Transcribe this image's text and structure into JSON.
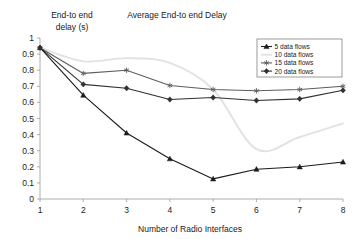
{
  "chart_data": {
    "type": "line",
    "title": "Average End-to end Delay",
    "xlabel": "Number of Radio Interfaces",
    "ylabel_line1": "End-to end",
    "ylabel_line2": "delay (s)",
    "ylabel": "End-to end delay (s)",
    "x": [
      1,
      2,
      3,
      4,
      5,
      6,
      7,
      8
    ],
    "xticks": [
      "1",
      "2",
      "3",
      "4",
      "5",
      "6",
      "7",
      "8"
    ],
    "yticks": [
      "0",
      "0.1",
      "0.2",
      "0.3",
      "0.4",
      "0.5",
      "0.6",
      "0.7",
      "0.8",
      "0.9",
      "1"
    ],
    "xlim": [
      1,
      8
    ],
    "ylim": [
      0,
      1
    ],
    "grid": false,
    "legend_position": "top-right",
    "series": [
      {
        "name": "5 data flows",
        "marker": "triangle",
        "color": "#1b1b1b",
        "values": [
          0.94,
          0.645,
          0.41,
          0.25,
          0.125,
          0.185,
          0.2,
          0.23
        ]
      },
      {
        "name": "10 data flows",
        "marker": "none",
        "color": "#e2e2e2",
        "smooth": true,
        "values": [
          0.94,
          0.855,
          0.875,
          0.845,
          0.68,
          0.31,
          0.385,
          0.47
        ]
      },
      {
        "name": "15 data flows",
        "marker": "asterisk",
        "color": "#5d5d5d",
        "values": [
          0.94,
          0.78,
          0.8,
          0.705,
          0.68,
          0.672,
          0.68,
          0.7
        ]
      },
      {
        "name": "20 data flows",
        "marker": "diamond",
        "color": "#303030",
        "values": [
          0.94,
          0.712,
          0.688,
          0.618,
          0.63,
          0.612,
          0.622,
          0.675
        ]
      }
    ]
  }
}
